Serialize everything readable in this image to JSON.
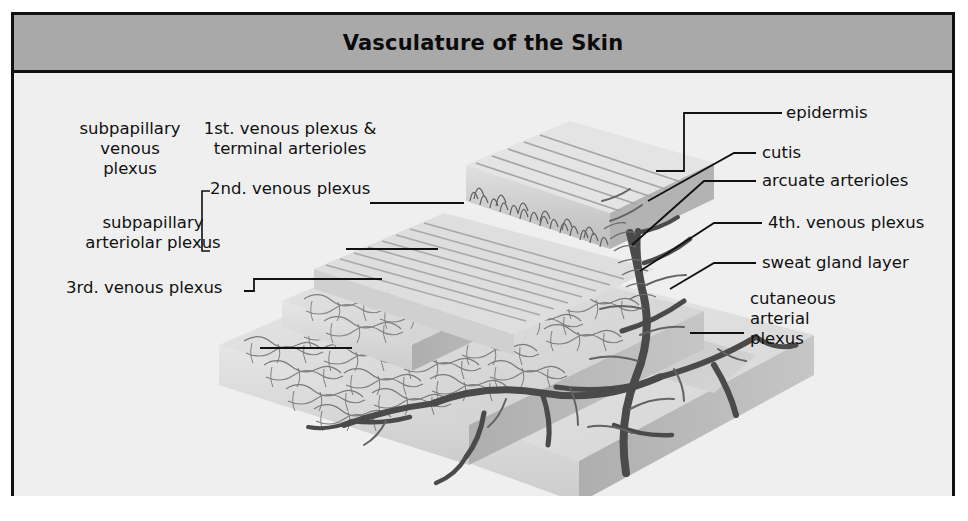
{
  "figure": {
    "title": "Vasculature of the Skin",
    "panel_marker": "b",
    "colors": {
      "frame": "#111111",
      "titlebar_bg": "#a9a9a9",
      "canvas_bg": "#efefef",
      "vessel_dark": "#4a4a4a",
      "vessel_fine": "#6d6d6d",
      "tissue_light": "#e3e3e3",
      "tissue_mid": "#cfcfcf",
      "tissue_shadow": "#b4b4b4",
      "label_text": "#111111"
    }
  },
  "labels": {
    "left": [
      {
        "id": "subpapillary-venous-plexus",
        "text": "subpapillary\nvenous\nplexus"
      },
      {
        "id": "first-venous-plexus",
        "text": "1st. venous plexus &\nterminal arterioles"
      },
      {
        "id": "second-venous-plexus",
        "text": "2nd. venous plexus"
      },
      {
        "id": "subpapillary-arteriolar-plexus",
        "text": "subpapillary\narteriolar plexus"
      },
      {
        "id": "third-venous-plexus",
        "text": "3rd. venous plexus"
      }
    ],
    "right": [
      {
        "id": "epidermis",
        "text": "epidermis"
      },
      {
        "id": "cutis",
        "text": "cutis"
      },
      {
        "id": "arcuate-arterioles",
        "text": "arcuate arterioles"
      },
      {
        "id": "fourth-venous-plexus",
        "text": "4th. venous plexus"
      },
      {
        "id": "sweat-gland-layer",
        "text": "sweat gland layer"
      },
      {
        "id": "cutaneous-arterial-plexus",
        "text": "cutaneous\narterial\nplexus"
      }
    ]
  }
}
